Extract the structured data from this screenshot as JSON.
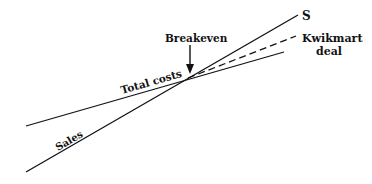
{
  "diagram": {
    "type": "breakeven-chart",
    "colors": {
      "line": "#111111",
      "background": "#ffffff"
    },
    "labels": {
      "sales_end": "S",
      "kwikmart_line1": "Kwikmart",
      "kwikmart_line2": "deal",
      "breakeven": "Breakeven",
      "total_costs": "Total costs",
      "sales": "Sales"
    },
    "lines": [
      {
        "name": "Sales",
        "style": "solid",
        "from": [
          26,
          172
        ],
        "to": [
          298,
          15
        ]
      },
      {
        "name": "Total costs",
        "style": "solid",
        "from": [
          26,
          126
        ],
        "to": [
          284,
          52
        ]
      },
      {
        "name": "Kwikmart deal",
        "style": "dashed",
        "from": [
          188,
          78
        ],
        "to": [
          296,
          36
        ]
      }
    ],
    "breakeven_point": [
      188,
      78
    ]
  }
}
